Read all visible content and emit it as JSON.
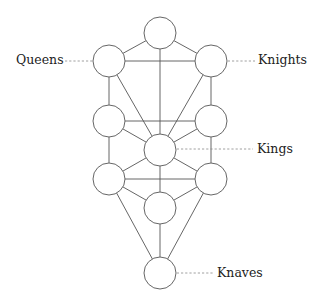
{
  "diagram": {
    "type": "tree-of-life-graph",
    "colors": {
      "background": "#ffffff",
      "edge": "#555555",
      "node_stroke": "#666666",
      "leader": "#888888",
      "label": "#222222"
    },
    "nodes": [
      {
        "id": "top",
        "cx": 160,
        "cy": 33,
        "r": 16
      },
      {
        "id": "upper-left",
        "cx": 109,
        "cy": 61,
        "r": 16
      },
      {
        "id": "upper-right",
        "cx": 211,
        "cy": 61,
        "r": 16
      },
      {
        "id": "middle-left",
        "cx": 109,
        "cy": 121,
        "r": 16
      },
      {
        "id": "middle-right",
        "cx": 211,
        "cy": 121,
        "r": 16
      },
      {
        "id": "center",
        "cx": 160,
        "cy": 150,
        "r": 16
      },
      {
        "id": "lower-left",
        "cx": 109,
        "cy": 179,
        "r": 16
      },
      {
        "id": "lower-right",
        "cx": 211,
        "cy": 179,
        "r": 16
      },
      {
        "id": "bottom-middle",
        "cx": 160,
        "cy": 208,
        "r": 16
      },
      {
        "id": "bottom",
        "cx": 160,
        "cy": 273,
        "r": 16
      }
    ],
    "edges": [
      [
        "top",
        "upper-left"
      ],
      [
        "top",
        "upper-right"
      ],
      [
        "top",
        "center"
      ],
      [
        "upper-left",
        "upper-right"
      ],
      [
        "upper-left",
        "middle-left"
      ],
      [
        "upper-right",
        "middle-right"
      ],
      [
        "upper-left",
        "center"
      ],
      [
        "upper-right",
        "center"
      ],
      [
        "middle-left",
        "middle-right"
      ],
      [
        "middle-left",
        "center"
      ],
      [
        "middle-right",
        "center"
      ],
      [
        "middle-left",
        "lower-left"
      ],
      [
        "middle-right",
        "lower-right"
      ],
      [
        "center",
        "lower-left"
      ],
      [
        "center",
        "lower-right"
      ],
      [
        "center",
        "bottom-middle"
      ],
      [
        "lower-left",
        "lower-right"
      ],
      [
        "lower-left",
        "bottom-middle"
      ],
      [
        "lower-right",
        "bottom-middle"
      ],
      [
        "bottom-middle",
        "bottom"
      ],
      [
        "lower-left",
        "bottom"
      ],
      [
        "lower-right",
        "bottom"
      ]
    ],
    "labels": [
      {
        "text": "Queens",
        "node": "upper-left",
        "x": 16,
        "y": 64,
        "anchor": "start",
        "leader": [
          65,
          61,
          109,
          61
        ]
      },
      {
        "text": "Knights",
        "node": "upper-right",
        "x": 258,
        "y": 64,
        "anchor": "start",
        "leader": [
          211,
          61,
          255,
          61
        ]
      },
      {
        "text": "Kings",
        "node": "center",
        "x": 257,
        "y": 153,
        "anchor": "start",
        "leader": [
          160,
          149,
          253,
          149
        ]
      },
      {
        "text": "Knaves",
        "node": "bottom",
        "x": 217,
        "y": 277,
        "anchor": "start",
        "leader": [
          160,
          273,
          213,
          273
        ]
      }
    ]
  }
}
